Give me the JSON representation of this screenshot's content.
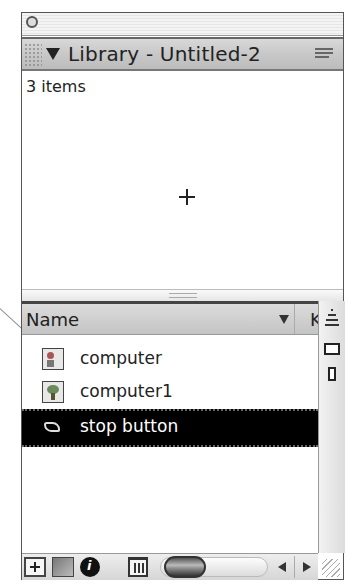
{
  "panel": {
    "title": "Library - Untitled-2",
    "item_count": "3 items",
    "collapse_icon": "triangle-down-icon",
    "options_menu_icon": "panel-options-menu-icon"
  },
  "columns": {
    "name": "Name",
    "next": "K",
    "sort_icon": "sort-descending-icon"
  },
  "side_buttons": [
    {
      "name": "sort-order-button",
      "icon": "sort-order-icon"
    },
    {
      "name": "wide-state-button",
      "icon": "wide-view-icon"
    },
    {
      "name": "narrow-state-button",
      "icon": "narrow-view-icon"
    }
  ],
  "items": [
    {
      "label": "computer",
      "type": "graphic",
      "icon": "graphic-symbol-icon",
      "selected": false
    },
    {
      "label": "computer1",
      "type": "bitmap",
      "icon": "bitmap-icon",
      "selected": false
    },
    {
      "label": "stop button",
      "type": "button",
      "icon": "button-symbol-icon",
      "selected": true
    }
  ],
  "toolbar": {
    "new_symbol": "new-symbol-icon",
    "new_folder": "new-folder-icon",
    "properties": "properties-icon",
    "delete": "trash-icon",
    "scroll_left": "arrow-left-icon",
    "scroll_right": "arrow-right-icon"
  },
  "colors": {
    "selected_row_bg": "#000000",
    "selected_row_text": "#ffffff",
    "titlebar_bg": "#c8c8c8"
  }
}
